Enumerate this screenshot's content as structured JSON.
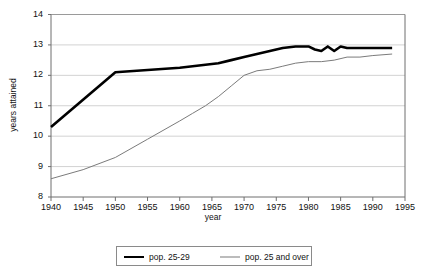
{
  "chart_data": {
    "type": "line",
    "title": "",
    "xlabel": "year",
    "ylabel": "years attained",
    "xlim": [
      1940,
      1995
    ],
    "ylim": [
      8,
      14
    ],
    "xticks": [
      1940,
      1945,
      1950,
      1955,
      1960,
      1965,
      1970,
      1975,
      1980,
      1985,
      1990,
      1995
    ],
    "yticks": [
      8,
      9,
      10,
      11,
      12,
      13,
      14
    ],
    "grid": "horizontal",
    "legend_position": "bottom",
    "series": [
      {
        "name": "pop. 25-29",
        "color": "#000000",
        "width": 2.6,
        "x": [
          1940,
          1950,
          1960,
          1962,
          1964,
          1966,
          1968,
          1970,
          1972,
          1974,
          1976,
          1978,
          1980,
          1981,
          1982,
          1983,
          1984,
          1985,
          1986,
          1988,
          1990,
          1993
        ],
        "values": [
          10.3,
          12.1,
          12.25,
          12.3,
          12.35,
          12.4,
          12.5,
          12.6,
          12.7,
          12.8,
          12.9,
          12.95,
          12.95,
          12.85,
          12.8,
          12.95,
          12.8,
          12.95,
          12.9,
          12.9,
          12.9,
          12.9
        ]
      },
      {
        "name": "pop. 25 and over",
        "color": "#7b7b7b",
        "width": 1,
        "x": [
          1940,
          1945,
          1950,
          1955,
          1960,
          1962,
          1964,
          1966,
          1968,
          1970,
          1972,
          1974,
          1976,
          1978,
          1980,
          1982,
          1984,
          1986,
          1988,
          1990,
          1993
        ],
        "values": [
          8.6,
          8.9,
          9.3,
          9.9,
          10.5,
          10.75,
          11.0,
          11.3,
          11.65,
          12.0,
          12.15,
          12.2,
          12.3,
          12.4,
          12.45,
          12.45,
          12.5,
          12.6,
          12.6,
          12.65,
          12.7
        ]
      }
    ]
  },
  "legend": {
    "items": [
      {
        "label": "pop. 25-29"
      },
      {
        "label": "pop. 25 and over"
      }
    ]
  }
}
